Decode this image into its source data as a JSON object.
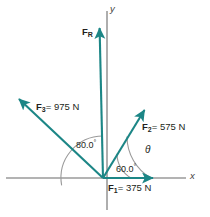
{
  "figure": {
    "background_color": "#ffffff",
    "vector_color": "#1c8686",
    "axis_color": "#9a9a9a",
    "arc_color": "#9a9a9a",
    "text_color": "#231f20"
  },
  "axes": {
    "x_label": "x",
    "y_label": "y",
    "origin": {
      "x": 103,
      "y": 178
    }
  },
  "vectors": [
    {
      "id": "F1",
      "name": "F",
      "subscript": "1",
      "magnitude": "375",
      "unit": "N",
      "label": "F1 = 375 N",
      "equals_text": "= 375 N",
      "angle_deg": 0,
      "tip": {
        "x": 160,
        "y": 178
      }
    },
    {
      "id": "F2",
      "name": "F",
      "subscript": "2",
      "magnitude": "575",
      "unit": "N",
      "label": "F2 = 575 N",
      "equals_text": "= 575 N",
      "angle_deg": 60,
      "tip": {
        "x": 148,
        "y": 106
      }
    },
    {
      "id": "F3",
      "name": "F",
      "subscript": "3",
      "magnitude": "975",
      "unit": "N",
      "label": "F3 = 975 N",
      "equals_text": "= 975 N",
      "angle_deg": 170,
      "tip": {
        "x": 14,
        "y": 95
      }
    },
    {
      "id": "FR",
      "name": "F",
      "subscript": "R",
      "magnitude": "",
      "unit": "",
      "label": "FR",
      "equals_text": "",
      "angle_deg": 93,
      "tip": {
        "x": 99,
        "y": 22
      }
    }
  ],
  "angles": [
    {
      "id": "angle-60",
      "value": "60.0",
      "degree_symbol": "°",
      "from": "x-axis",
      "to": "F2",
      "arc_radius": 28
    },
    {
      "id": "angle-80",
      "value": "80.0",
      "degree_symbol": "°",
      "from": "F3",
      "to": "y-axis",
      "arc_radius": 42
    },
    {
      "id": "angle-theta",
      "value": "θ",
      "degree_symbol": "",
      "from": "F2",
      "to": "x-axis",
      "arc_radius": 48
    }
  ]
}
